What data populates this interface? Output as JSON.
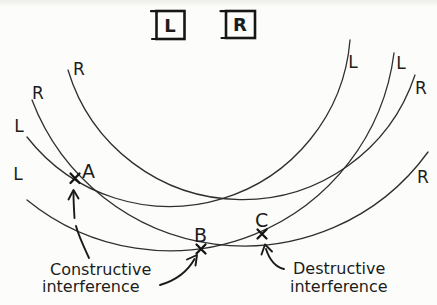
{
  "speakers": {
    "left_label": "L",
    "right_label": "R"
  },
  "wavefront_labels": {
    "left_side": [
      "R",
      "R",
      "L",
      "L"
    ],
    "right_side": [
      "L",
      "L",
      "R",
      "R"
    ]
  },
  "points": {
    "a": "A",
    "b": "B",
    "c": "C"
  },
  "annotations": {
    "constructive_line1": "Constructive",
    "constructive_line2": "interference",
    "destructive_line1": "Destructive",
    "destructive_line2": "interference"
  },
  "glyphs": {
    "point_marker": "x-mark",
    "arrow": "curved-arrow"
  },
  "colors": {
    "ink": "#1c1c1c",
    "wavefront_stroke": "#2f2f2f",
    "paper": "#fcfcfa"
  }
}
